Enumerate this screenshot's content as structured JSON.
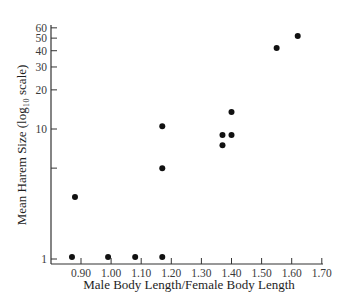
{
  "chart_data": {
    "type": "scatter",
    "title": "",
    "xlabel": "Male Body Length/Female Body Length",
    "ylabel": "Mean Harem Size (log₁₀ scale)",
    "yscale": "log10",
    "xlim": [
      0.83,
      1.7
    ],
    "ylim": [
      0.95,
      60
    ],
    "grid": false,
    "legend": null,
    "x_ticks": [
      "0.90",
      "1.00",
      "1.10",
      "1.20",
      "1.30",
      "1.40",
      "1.50",
      "1.60",
      "1.70"
    ],
    "y_ticks": [
      {
        "value": 1,
        "label": "1"
      },
      {
        "value": 5,
        "label": ""
      },
      {
        "value": 10,
        "label": "10"
      },
      {
        "value": 20,
        "label": "20"
      },
      {
        "value": 30,
        "label": "30"
      },
      {
        "value": 40,
        "label": "40"
      },
      {
        "value": 50,
        "label": "50"
      },
      {
        "value": 60,
        "label": "60"
      }
    ],
    "points": [
      {
        "x": 0.87,
        "y": 1.0
      },
      {
        "x": 0.88,
        "y": 3.0
      },
      {
        "x": 0.99,
        "y": 1.0
      },
      {
        "x": 1.08,
        "y": 1.0
      },
      {
        "x": 1.17,
        "y": 1.0
      },
      {
        "x": 1.17,
        "y": 5.0
      },
      {
        "x": 1.17,
        "y": 10.5
      },
      {
        "x": 1.37,
        "y": 9.0
      },
      {
        "x": 1.37,
        "y": 7.5
      },
      {
        "x": 1.4,
        "y": 9.0
      },
      {
        "x": 1.4,
        "y": 13.5
      },
      {
        "x": 1.55,
        "y": 42
      },
      {
        "x": 1.62,
        "y": 52
      }
    ]
  }
}
